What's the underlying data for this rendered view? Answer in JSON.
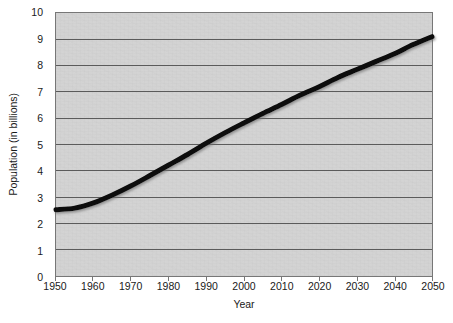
{
  "chart_data": {
    "type": "line",
    "title": "",
    "subtitle": "",
    "xlabel": "Year",
    "ylabel": "Population (in billions)",
    "xlim": [
      1950,
      2050
    ],
    "ylim": [
      0,
      10
    ],
    "grid": "horizontal",
    "legend": "none",
    "line_color": "#0d0d0d",
    "plot_background": "#d2d2d2",
    "page_background": "#ffffff",
    "gridline_color": "#5a5a5a",
    "axis_color": "#777777",
    "xticks": [
      1950,
      1960,
      1970,
      1980,
      1990,
      2000,
      2010,
      2020,
      2030,
      2040,
      2050
    ],
    "xtick_labels": [
      "1950",
      "1960",
      "1970",
      "1980",
      "1990",
      "2000",
      "2010",
      "2020",
      "2030",
      "2040",
      "2050"
    ],
    "yticks": [
      0,
      1,
      2,
      3,
      4,
      5,
      6,
      7,
      8,
      9,
      10
    ],
    "ytick_labels": [
      "0",
      "1",
      "2",
      "3",
      "4",
      "5",
      "6",
      "7",
      "8",
      "9",
      "10"
    ],
    "series": [
      {
        "name": "World population",
        "x": [
          1950,
          1955,
          1960,
          1965,
          1970,
          1975,
          1980,
          1985,
          1990,
          1995,
          2000,
          2005,
          2010,
          2015,
          2020,
          2025,
          2030,
          2035,
          2040,
          2045,
          2050
        ],
        "values": [
          2.52,
          2.58,
          2.78,
          3.08,
          3.43,
          3.82,
          4.22,
          4.62,
          5.05,
          5.45,
          5.82,
          6.18,
          6.52,
          6.88,
          7.2,
          7.55,
          7.85,
          8.15,
          8.45,
          8.8,
          9.1
        ]
      }
    ]
  }
}
